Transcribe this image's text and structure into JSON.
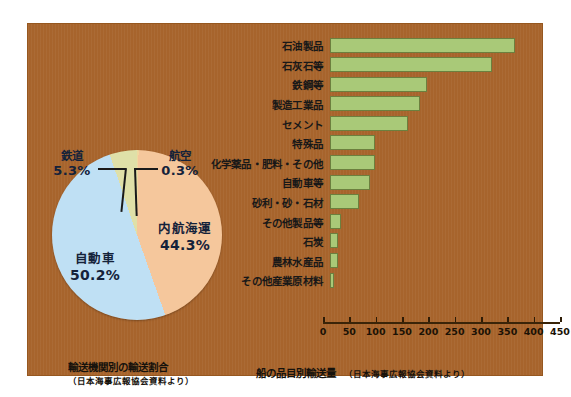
{
  "panel": {
    "background_color": "#a7642c"
  },
  "pie_caption": {
    "title": "輸送機関別の輸送割合",
    "source": "（日本海事広報協会資料より）"
  },
  "bar_caption": {
    "title": "船の品目別輸送量",
    "source": "（日本海事広報協会資料より）"
  },
  "chart_data": [
    {
      "type": "pie",
      "title": "輸送機関別の輸送割合",
      "annotation": "（日本海事広報協会資料より）",
      "legend": "inside-and-callout",
      "grid": false,
      "unit": "%",
      "categories": [
        "自動車",
        "内航海運",
        "鉄道",
        "航空"
      ],
      "values": [
        50.2,
        44.3,
        5.3,
        0.3
      ],
      "labels": [
        "50.2%",
        "44.3%",
        "5.3%",
        "0.3%"
      ],
      "colors": [
        "#bfe0f4",
        "#f5c79c",
        "#dfe0a8",
        "#f0d9a0"
      ],
      "slices": [
        {
          "name": "自動車",
          "value": 50.2,
          "label": "50.2%",
          "color": "#bfe0f4",
          "callout": false
        },
        {
          "name": "内航海運",
          "value": 44.3,
          "label": "44.3%",
          "color": "#f5c79c",
          "callout": false
        },
        {
          "name": "鉄道",
          "value": 5.3,
          "label": "5.3%",
          "color": "#dfe0a8",
          "callout": true
        },
        {
          "name": "航空",
          "value": 0.3,
          "label": "0.3%",
          "color": "#f0d9a0",
          "callout": true
        }
      ]
    },
    {
      "type": "bar",
      "orientation": "horizontal",
      "title": "船の品目別輸送量",
      "annotation": "（日本海事広報協会資料より）",
      "xlabel": "",
      "ylabel": "",
      "xlim": [
        0,
        450
      ],
      "grid": false,
      "bar_color": "#a9c978",
      "bar_border_color": "#6c7f3e",
      "ticks": [
        0,
        50,
        100,
        150,
        200,
        250,
        300,
        350,
        400,
        450
      ],
      "tick_labels": [
        "0",
        "50",
        "100",
        "150",
        "200",
        "250",
        "300",
        "350",
        "400",
        "450"
      ],
      "categories": [
        "石油製品",
        "石灰石等",
        "鉄鋼等",
        "製造工業品",
        "セメント",
        "特殊品",
        "化学薬品・肥料・その他",
        "自動車等",
        "砂利・砂・石材",
        "その他製品等",
        "石炭",
        "農林水産品",
        "その他産業原材料"
      ],
      "values": [
        410,
        360,
        215,
        200,
        172,
        100,
        100,
        88,
        65,
        25,
        17,
        17,
        8
      ]
    }
  ]
}
